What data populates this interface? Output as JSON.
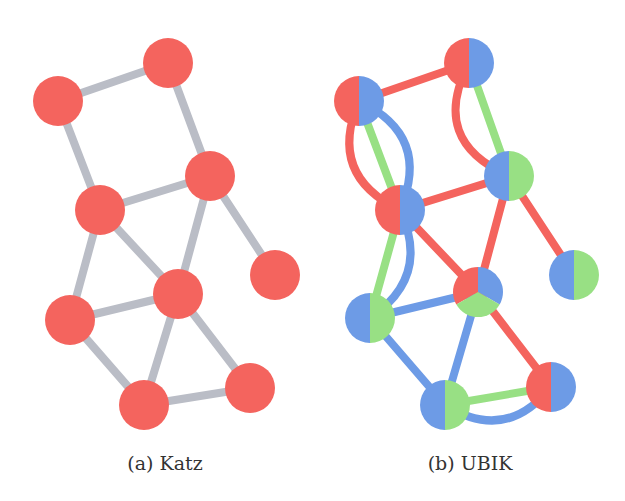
{
  "colors": {
    "red": "#f4645e",
    "blue": "#6d9be6",
    "green": "#98e084",
    "gray_edge": "#babdc6"
  },
  "panels": [
    {
      "id": "a",
      "caption": "(a) Katz",
      "caption_pos": [
        165,
        452
      ],
      "node_radius": 25,
      "nodes": [
        {
          "id": "A",
          "x": 58,
          "y": 101,
          "colors": [
            "red"
          ]
        },
        {
          "id": "B",
          "x": 168,
          "y": 63,
          "colors": [
            "red"
          ]
        },
        {
          "id": "C",
          "x": 210,
          "y": 176,
          "colors": [
            "red"
          ]
        },
        {
          "id": "D",
          "x": 100,
          "y": 210,
          "colors": [
            "red"
          ]
        },
        {
          "id": "E",
          "x": 275,
          "y": 275,
          "colors": [
            "red"
          ]
        },
        {
          "id": "F",
          "x": 178,
          "y": 294,
          "colors": [
            "red"
          ]
        },
        {
          "id": "G",
          "x": 70,
          "y": 320,
          "colors": [
            "red"
          ]
        },
        {
          "id": "H",
          "x": 144,
          "y": 405,
          "colors": [
            "red"
          ]
        },
        {
          "id": "I",
          "x": 250,
          "y": 388,
          "colors": [
            "red"
          ]
        }
      ],
      "edges": [
        {
          "from": "A",
          "to": "B",
          "color": "gray_edge"
        },
        {
          "from": "B",
          "to": "C",
          "color": "gray_edge"
        },
        {
          "from": "A",
          "to": "D",
          "color": "gray_edge"
        },
        {
          "from": "D",
          "to": "C",
          "color": "gray_edge"
        },
        {
          "from": "C",
          "to": "E",
          "color": "gray_edge"
        },
        {
          "from": "C",
          "to": "F",
          "color": "gray_edge"
        },
        {
          "from": "D",
          "to": "F",
          "color": "gray_edge"
        },
        {
          "from": "D",
          "to": "G",
          "color": "gray_edge"
        },
        {
          "from": "G",
          "to": "F",
          "color": "gray_edge"
        },
        {
          "from": "G",
          "to": "H",
          "color": "gray_edge"
        },
        {
          "from": "F",
          "to": "H",
          "color": "gray_edge"
        },
        {
          "from": "F",
          "to": "I",
          "color": "gray_edge"
        },
        {
          "from": "H",
          "to": "I",
          "color": "gray_edge"
        }
      ]
    },
    {
      "id": "b",
      "caption": "(b) UBIK",
      "caption_pos": [
        470,
        452
      ],
      "node_radius": 25,
      "nodes": [
        {
          "id": "A",
          "x": 359,
          "y": 101,
          "colors": [
            "red",
            "blue"
          ]
        },
        {
          "id": "B",
          "x": 469,
          "y": 63,
          "colors": [
            "red",
            "blue"
          ]
        },
        {
          "id": "C",
          "x": 509,
          "y": 176,
          "colors": [
            "blue",
            "green"
          ]
        },
        {
          "id": "D",
          "x": 400,
          "y": 210,
          "colors": [
            "red",
            "blue"
          ]
        },
        {
          "id": "E",
          "x": 574,
          "y": 275,
          "colors": [
            "blue",
            "green"
          ]
        },
        {
          "id": "F",
          "x": 478,
          "y": 292,
          "colors": [
            "red",
            "blue",
            "green"
          ]
        },
        {
          "id": "G",
          "x": 370,
          "y": 318,
          "colors": [
            "blue",
            "green"
          ]
        },
        {
          "id": "H",
          "x": 445,
          "y": 405,
          "colors": [
            "blue",
            "green"
          ]
        },
        {
          "id": "I",
          "x": 551,
          "y": 387,
          "colors": [
            "red",
            "blue"
          ]
        }
      ],
      "edges": [
        {
          "from": "A",
          "to": "B",
          "color": "red",
          "bend": 0
        },
        {
          "from": "B",
          "to": "C",
          "color": "green",
          "bend": 0
        },
        {
          "from": "B",
          "to": "C",
          "color": "red",
          "bend": 40
        },
        {
          "from": "A",
          "to": "D",
          "color": "green",
          "bend": 0
        },
        {
          "from": "A",
          "to": "D",
          "color": "blue",
          "bend": -35
        },
        {
          "from": "A",
          "to": "D",
          "color": "red",
          "bend": 35
        },
        {
          "from": "D",
          "to": "C",
          "color": "red",
          "bend": 0
        },
        {
          "from": "C",
          "to": "E",
          "color": "red",
          "bend": 0
        },
        {
          "from": "C",
          "to": "F",
          "color": "red",
          "bend": 0
        },
        {
          "from": "D",
          "to": "F",
          "color": "red",
          "bend": 0
        },
        {
          "from": "D",
          "to": "G",
          "color": "green",
          "bend": 0
        },
        {
          "from": "D",
          "to": "G",
          "color": "blue",
          "bend": -30
        },
        {
          "from": "G",
          "to": "F",
          "color": "blue",
          "bend": 0
        },
        {
          "from": "G",
          "to": "H",
          "color": "blue",
          "bend": 0
        },
        {
          "from": "F",
          "to": "H",
          "color": "blue",
          "bend": 0
        },
        {
          "from": "F",
          "to": "I",
          "color": "red",
          "bend": 0
        },
        {
          "from": "H",
          "to": "I",
          "color": "green",
          "bend": 0
        },
        {
          "from": "H",
          "to": "I",
          "color": "blue",
          "bend": 30
        }
      ]
    }
  ]
}
